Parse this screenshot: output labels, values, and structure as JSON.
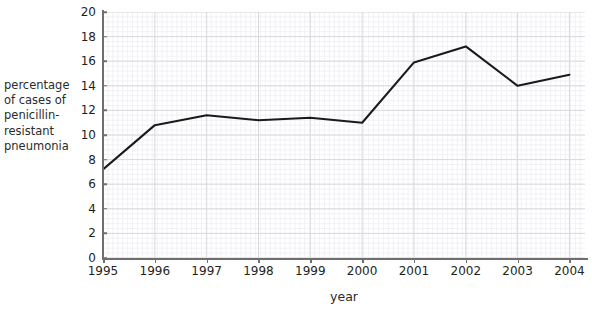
{
  "chart_data": {
    "type": "line",
    "title": "",
    "xlabel": "year",
    "ylabel": "percentage of cases of penicillin-resistant pneumonia",
    "categories": [
      "1995",
      "1996",
      "1997",
      "1998",
      "1999",
      "2000",
      "2001",
      "2002",
      "2003",
      "2004"
    ],
    "values": [
      7.2,
      10.8,
      11.6,
      11.2,
      11.4,
      11.0,
      15.9,
      17.2,
      14.0,
      14.9
    ],
    "series": [
      {
        "name": "percentage of cases of penicillin-resistant pneumonia",
        "values": [
          7.2,
          10.8,
          11.6,
          11.2,
          11.4,
          11.0,
          15.9,
          17.2,
          14.0,
          14.9
        ]
      }
    ],
    "xlim": [
      "1995",
      "2004"
    ],
    "ylim": [
      0,
      20
    ],
    "y_ticks": [
      0,
      2,
      4,
      6,
      8,
      10,
      12,
      14,
      16,
      18,
      20
    ],
    "y_tick_labels": [
      "0",
      "2",
      "4",
      "6",
      "8",
      "10",
      "12",
      "14",
      "16",
      "18",
      "20"
    ],
    "x_tick_labels": [
      "1995",
      "1996",
      "1997",
      "1998",
      "1999",
      "2000",
      "2001",
      "2002",
      "2003",
      "2004"
    ],
    "grid": true,
    "minor_grid": true,
    "legend": false,
    "legend_position": "none",
    "line_color": "#1a1a1a",
    "grid_color": "#d8d8de",
    "minor_grid_color": "#ededf2",
    "axis_color": "#6f6f6f",
    "background_color": "#ffffff"
  },
  "axis_labels": {
    "y_title": "percentage\nof cases of\npenicillin-\nresistant\npneumonia",
    "x_title": "year"
  }
}
